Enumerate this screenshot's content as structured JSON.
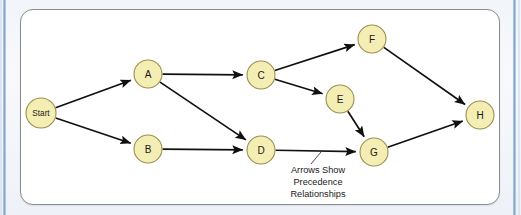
{
  "figure": {
    "panel_background": "#ffffff",
    "panel_border_color": "#8c8c88",
    "page_background": "#eef2f8",
    "node_fill": "#f4edb4",
    "node_stroke": "#9a8f4e",
    "edge_color": "#101010"
  },
  "nodes": [
    {
      "id": "start",
      "label": "Start",
      "cx": 41,
      "cy": 113,
      "r": 15
    },
    {
      "id": "a",
      "label": "A",
      "cx": 148,
      "cy": 74,
      "r": 14
    },
    {
      "id": "b",
      "label": "B",
      "cx": 148,
      "cy": 149,
      "r": 14
    },
    {
      "id": "c",
      "label": "C",
      "cx": 261,
      "cy": 75,
      "r": 14
    },
    {
      "id": "d",
      "label": "D",
      "cx": 261,
      "cy": 150,
      "r": 14
    },
    {
      "id": "e",
      "label": "E",
      "cx": 340,
      "cy": 99,
      "r": 14
    },
    {
      "id": "f",
      "label": "F",
      "cx": 372,
      "cy": 39,
      "r": 14
    },
    {
      "id": "g",
      "label": "G",
      "cx": 374,
      "cy": 152,
      "r": 14
    },
    {
      "id": "h",
      "label": "H",
      "cx": 480,
      "cy": 115,
      "r": 14
    }
  ],
  "edges": [
    {
      "id": "start-a",
      "from": "start",
      "to": "a"
    },
    {
      "id": "start-b",
      "from": "start",
      "to": "b"
    },
    {
      "id": "a-c",
      "from": "a",
      "to": "c"
    },
    {
      "id": "a-d",
      "from": "a",
      "to": "d"
    },
    {
      "id": "b-d",
      "from": "b",
      "to": "d"
    },
    {
      "id": "c-f",
      "from": "c",
      "to": "f"
    },
    {
      "id": "c-e",
      "from": "c",
      "to": "e"
    },
    {
      "id": "d-g",
      "from": "d",
      "to": "g"
    },
    {
      "id": "e-g",
      "from": "e",
      "to": "g"
    },
    {
      "id": "f-h",
      "from": "f",
      "to": "h"
    },
    {
      "id": "g-h",
      "from": "g",
      "to": "h"
    }
  ],
  "annotation": {
    "lines": [
      "Arrows Show",
      "Precedence",
      "Relationships"
    ],
    "line1": "Arrows Show",
    "line2": "Precedence",
    "line3": "Relationships",
    "anchor_x": 318,
    "anchor_y": 170
  },
  "chart_data": {
    "type": "diagram",
    "subtype": "directed-acyclic-graph",
    "node_ids": [
      "Start",
      "A",
      "B",
      "C",
      "D",
      "E",
      "F",
      "G",
      "H"
    ],
    "edge_pairs": [
      [
        "Start",
        "A"
      ],
      [
        "Start",
        "B"
      ],
      [
        "A",
        "C"
      ],
      [
        "A",
        "D"
      ],
      [
        "B",
        "D"
      ],
      [
        "C",
        "F"
      ],
      [
        "C",
        "E"
      ],
      [
        "D",
        "G"
      ],
      [
        "E",
        "G"
      ],
      [
        "F",
        "H"
      ],
      [
        "G",
        "H"
      ]
    ],
    "annotation": "Arrows Show Precedence Relationships"
  }
}
